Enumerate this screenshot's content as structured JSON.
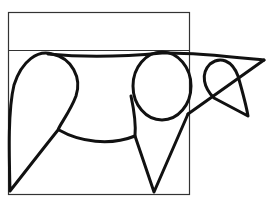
{
  "figure": {
    "colors": {
      "background": "#ffffff",
      "line": "#111111",
      "frame": "#333333"
    },
    "shapes": [
      {
        "name": "outer-rectangle",
        "type": "rectangle"
      },
      {
        "name": "top-divider-line",
        "type": "line"
      },
      {
        "name": "back-line",
        "type": "curve"
      },
      {
        "name": "rear-leg-teardrop",
        "type": "teardrop"
      },
      {
        "name": "belly-curve",
        "type": "arc"
      },
      {
        "name": "front-body-circle",
        "type": "circle"
      },
      {
        "name": "front-leg-triangle",
        "type": "triangle"
      },
      {
        "name": "head-loop",
        "type": "loop"
      },
      {
        "name": "head-triangle",
        "type": "triangle"
      }
    ]
  }
}
